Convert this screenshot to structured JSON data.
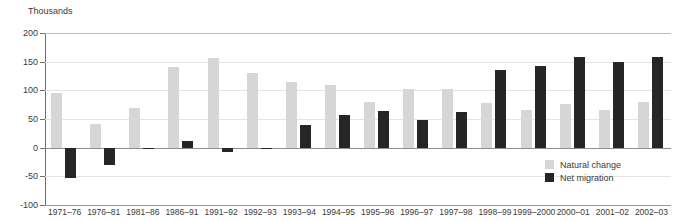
{
  "header": {
    "clipped_line": "",
    "axis_unit": "Thousands"
  },
  "legend": {
    "position": "bottom-right",
    "items": [
      {
        "label": "Natural change",
        "color": "#d6d6d6",
        "key": "natural"
      },
      {
        "label": "Net migration",
        "color": "#262626",
        "key": "migration"
      }
    ]
  },
  "chart_data": {
    "type": "bar",
    "title": "",
    "subtitle": "",
    "xlabel": "",
    "ylabel": "Thousands",
    "ylim": [
      -100,
      200
    ],
    "yticks": [
      200,
      150,
      100,
      50,
      0,
      -50,
      -100
    ],
    "ytick_labels": [
      "200",
      "150",
      "100",
      "50",
      "0",
      "-50",
      "-100"
    ],
    "grid": true,
    "grid_axis": "y",
    "categories": [
      "1971–76",
      "1976–81",
      "1981–86",
      "1986–91",
      "1991–92",
      "1992–93",
      "1993–94",
      "1994–95",
      "1995–96",
      "1996–97",
      "1997–98",
      "1998–99",
      "1999–2000",
      "2000–01",
      "2001–02",
      "2002–03"
    ],
    "series": [
      {
        "name": "Natural change",
        "color": "#d6d6d6",
        "values": [
          95,
          42,
          70,
          140,
          157,
          130,
          114,
          110,
          79,
          103,
          103,
          78,
          65,
          76,
          65,
          79
        ]
      },
      {
        "name": "Net migration",
        "color": "#262626",
        "values": [
          -53,
          -30,
          -2,
          12,
          -7,
          0,
          39,
          57,
          64,
          49,
          62,
          135,
          142,
          158,
          150,
          158
        ]
      }
    ]
  }
}
